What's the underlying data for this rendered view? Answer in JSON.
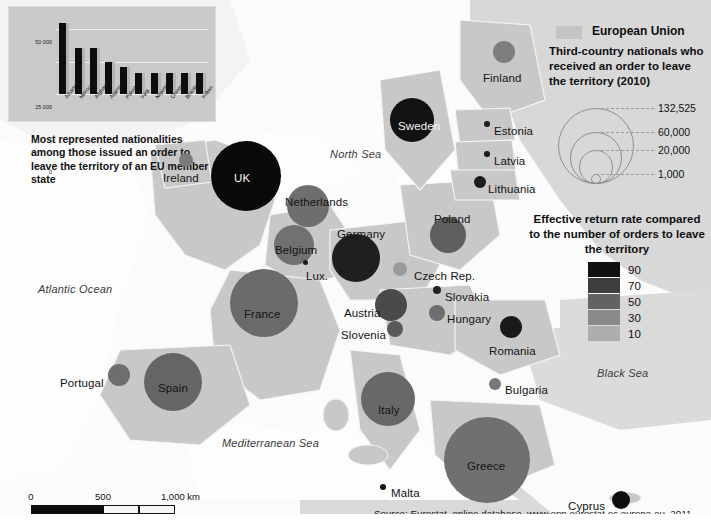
{
  "legend": {
    "eu_swatch_label": "European Union",
    "bubble_title": "Third-country nationals who received an order to leave the territory (2010)",
    "bubble_values": [
      "132,525",
      "60,000",
      "20,000",
      "1,000"
    ],
    "rate_title": "Effective return rate compared to the number of orders to leave the territory",
    "rate_values": [
      "90",
      "70",
      "50",
      "30",
      "10"
    ],
    "rate_colors": [
      "#111111",
      "#3d3d3d",
      "#626262",
      "#8a8a8a",
      "#aeaeae"
    ]
  },
  "inset": {
    "caption": "Most represented nationalities among those issued an order to leave the territory of an EU member state",
    "y_ticks": [
      "50 000",
      "25 000",
      "0"
    ]
  },
  "chart_data": {
    "type": "bar",
    "title": "Most represented nationalities among those issued an order to leave the territory of an EU member state",
    "xlabel": "",
    "ylabel": "",
    "ylim": [
      0,
      60000
    ],
    "yticks": [
      0,
      25000,
      50000
    ],
    "grid": true,
    "categories": [
      "Albanian",
      "Moroccan",
      "Afghan",
      "Algerian",
      "Pakistani",
      "Iraqi",
      "Nigerian",
      "Chinese",
      "Brazilian",
      "Indian"
    ],
    "values": [
      55000,
      35500,
      35500,
      25000,
      21000,
      16000,
      16000,
      16000,
      16000,
      16500
    ]
  },
  "map": {
    "sea_labels": [
      {
        "name": "North Sea",
        "x": 330,
        "y": 148
      },
      {
        "name": "Atlantic Ocean",
        "x": 38,
        "y": 283
      },
      {
        "name": "Mediterranean Sea",
        "x": 222,
        "y": 437
      },
      {
        "name": "Black Sea",
        "x": 597,
        "y": 367
      }
    ],
    "countries": [
      {
        "name": "Ireland",
        "lx": 163,
        "ly": 172,
        "cx": 186,
        "cy": 160,
        "r": 7,
        "color": "#7b7b7b",
        "label_color": "dark"
      },
      {
        "name": "UK",
        "lx": 234,
        "ly": 172,
        "cx": 246,
        "cy": 176,
        "r": 35,
        "color": "#0a0a0a",
        "label_color": "light"
      },
      {
        "name": "Netherlands",
        "lx": 285,
        "ly": 196,
        "cx": 308,
        "cy": 206,
        "r": 21,
        "color": "#6e6e6e",
        "label_color": "dark"
      },
      {
        "name": "Belgium",
        "lx": 275,
        "ly": 244,
        "cx": 294,
        "cy": 245,
        "r": 20,
        "color": "#717171",
        "label_color": "dark"
      },
      {
        "name": "Lux.",
        "lx": 306,
        "ly": 270,
        "cx": 305,
        "cy": 262,
        "r": 2.5,
        "color": "#1d1d1d",
        "label_color": "dark"
      },
      {
        "name": "Germany",
        "lx": 337,
        "ly": 228,
        "cx": 356,
        "cy": 258,
        "r": 24,
        "color": "#1f1f1f",
        "label_color": "dark"
      },
      {
        "name": "France",
        "lx": 244,
        "ly": 308,
        "cx": 264,
        "cy": 303,
        "r": 34,
        "color": "#6b6b6b",
        "label_color": "dark"
      },
      {
        "name": "Portugal",
        "lx": 60,
        "ly": 377,
        "cx": 119,
        "cy": 375,
        "r": 11,
        "color": "#6e6e6e",
        "label_color": "dark"
      },
      {
        "name": "Spain",
        "lx": 158,
        "ly": 382,
        "cx": 173,
        "cy": 382,
        "r": 29,
        "color": "#656565",
        "label_color": "dark"
      },
      {
        "name": "Italy",
        "lx": 378,
        "ly": 404,
        "cx": 388,
        "cy": 399,
        "r": 27,
        "color": "#686868",
        "label_color": "dark"
      },
      {
        "name": "Sweden",
        "lx": 398,
        "ly": 120,
        "cx": 412,
        "cy": 120,
        "r": 22,
        "color": "#121212",
        "label_color": "light"
      },
      {
        "name": "Finland",
        "lx": 483,
        "ly": 72,
        "cx": 504,
        "cy": 52,
        "r": 11,
        "color": "#7d7d7d",
        "label_color": "dark"
      },
      {
        "name": "Estonia",
        "lx": 494,
        "ly": 125,
        "cx": 487,
        "cy": 124,
        "r": 2.8,
        "color": "#1d1d1d",
        "label_color": "dark"
      },
      {
        "name": "Latvia",
        "lx": 494,
        "ly": 155,
        "cx": 487,
        "cy": 154,
        "r": 2.8,
        "color": "#1d1d1d",
        "label_color": "dark"
      },
      {
        "name": "Lithuania",
        "lx": 488,
        "ly": 183,
        "cx": 480,
        "cy": 182,
        "r": 6,
        "color": "#1b1b1b",
        "label_color": "dark"
      },
      {
        "name": "Poland",
        "lx": 434,
        "ly": 213,
        "cx": 448,
        "cy": 235,
        "r": 18,
        "color": "#5e5e5e",
        "label_color": "dark"
      },
      {
        "name": "Czech Rep.",
        "lx": 414,
        "ly": 270,
        "cx": 400,
        "cy": 269,
        "r": 7,
        "color": "#9a9a9a",
        "label_color": "dark"
      },
      {
        "name": "Slovakia",
        "lx": 445,
        "ly": 291,
        "cx": 437,
        "cy": 290,
        "r": 4,
        "color": "#222222",
        "label_color": "dark"
      },
      {
        "name": "Austria",
        "lx": 344,
        "ly": 307,
        "cx": 391,
        "cy": 305,
        "r": 16,
        "color": "#4a4a4a",
        "label_color": "dark"
      },
      {
        "name": "Hungary",
        "lx": 447,
        "ly": 313,
        "cx": 437,
        "cy": 313,
        "r": 8,
        "color": "#6e6e6e",
        "label_color": "dark"
      },
      {
        "name": "Slovenia",
        "lx": 341,
        "ly": 329,
        "cx": 395,
        "cy": 329,
        "r": 8,
        "color": "#5a5a5a",
        "label_color": "dark"
      },
      {
        "name": "Romania",
        "lx": 489,
        "ly": 345,
        "cx": 511,
        "cy": 327,
        "r": 11,
        "color": "#1a1a1a",
        "label_color": "dark"
      },
      {
        "name": "Bulgaria",
        "lx": 505,
        "ly": 384,
        "cx": 495,
        "cy": 384,
        "r": 6,
        "color": "#777777",
        "label_color": "dark"
      },
      {
        "name": "Greece",
        "lx": 467,
        "ly": 460,
        "cx": 487,
        "cy": 460,
        "r": 43,
        "color": "#707070",
        "label_color": "dark"
      },
      {
        "name": "Malta",
        "lx": 391,
        "ly": 487,
        "cx": 383,
        "cy": 487,
        "r": 3,
        "color": "#141414",
        "label_color": "dark"
      },
      {
        "name": "Cyprus",
        "lx": 568,
        "ly": 500,
        "cx": 621,
        "cy": 500,
        "r": 9,
        "color": "#0e0e0e",
        "label_color": "dark"
      }
    ]
  },
  "scale": {
    "ticks": [
      "0",
      "500",
      "1,000 km"
    ]
  },
  "source": "Source: Eurostat, online database, www.epp.eurostat.ec.europa.eu, 2011."
}
